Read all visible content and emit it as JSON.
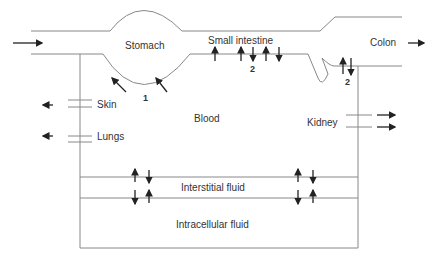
{
  "diagram": {
    "labels": {
      "stomach": "Stomach",
      "small_intestine": "Small intestine",
      "colon": "Colon",
      "blood": "Blood",
      "skin": "Skin",
      "lungs": "Lungs",
      "kidney": "Kidney",
      "interstitial": "Interstitial fluid",
      "intracellular": "Intracellular fluid",
      "marker_1": "1",
      "marker_2a": "2",
      "marker_2b": "2"
    },
    "colors": {
      "line": "#888888",
      "arrow": "#222222",
      "text": "#333333"
    }
  }
}
